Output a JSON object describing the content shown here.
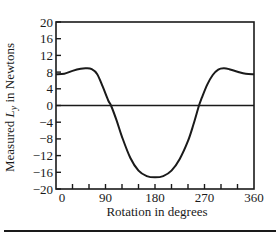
{
  "chart_data": {
    "type": "line",
    "title": "",
    "xlabel": "Rotation in degrees",
    "ylabel": "Measured L_y in Newtons",
    "ylabel_parts": {
      "prefix": "Measured ",
      "symbol": "L",
      "subscript": "y",
      "suffix": " in Newtons"
    },
    "xlim": [
      0,
      360
    ],
    "ylim": [
      -20,
      20
    ],
    "x_ticks": [
      0,
      90,
      180,
      270,
      360
    ],
    "x_minor_step": 30,
    "y_ticks": [
      20,
      16,
      12,
      8,
      4,
      0,
      -4,
      -8,
      -12,
      -16,
      -20
    ],
    "y_tick_labels": [
      "20",
      "16",
      "12",
      "8",
      "4",
      "0",
      "−4",
      "−8",
      "−12",
      "−16",
      "−20"
    ],
    "x_tick_labels": [
      "0",
      "90",
      "180",
      "270",
      "360"
    ],
    "grid": false,
    "zero_line": true,
    "series": [
      {
        "name": "Measured Ly",
        "x": [
          0,
          15,
          30,
          45,
          55,
          65,
          75,
          85,
          95,
          100,
          110,
          120,
          135,
          150,
          165,
          180,
          195,
          210,
          225,
          240,
          250,
          260,
          265,
          275,
          285,
          295,
          305,
          315,
          330,
          345,
          360
        ],
        "y": [
          7.5,
          7.6,
          8.3,
          8.8,
          8.9,
          8.7,
          7.5,
          4.5,
          1.2,
          0,
          -3.5,
          -7.5,
          -12.5,
          -15.6,
          -16.9,
          -17.2,
          -16.9,
          -15.6,
          -12.8,
          -8.5,
          -4.5,
          0,
          1.8,
          5.0,
          7.3,
          8.6,
          8.9,
          8.7,
          8.1,
          7.6,
          7.5
        ]
      }
    ]
  },
  "figure": {
    "bottom_rule": true
  }
}
